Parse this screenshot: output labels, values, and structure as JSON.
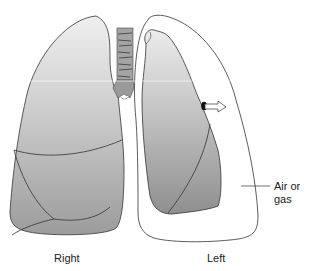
{
  "diagram": {
    "labels": {
      "right": "Right",
      "left": "Left",
      "air_or_gas": "Air or gas"
    },
    "colors": {
      "lung_light": "#e6e6e6",
      "lung_mid": "#bdbdbd",
      "lung_dark": "#9a9a9a",
      "outline": "#333333",
      "pleural_space": "#ffffff",
      "trachea": "#9c9c9c"
    }
  }
}
